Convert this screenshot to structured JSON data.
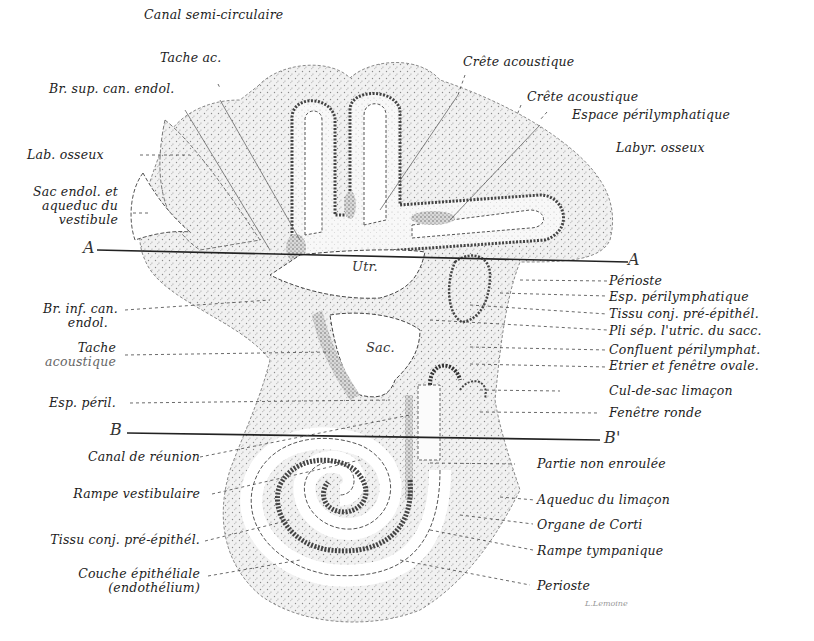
{
  "figure": {
    "cut_lines": [
      {
        "id": "A",
        "start_label": "A",
        "end_label": "A"
      },
      {
        "id": "B",
        "start_label": "B",
        "end_label": "B'"
      }
    ],
    "center_labels": {
      "utricle": "Utr.",
      "saccule": "Sac."
    },
    "labels_top": [
      {
        "text": "Canal semi-circulaire"
      },
      {
        "text": "Tache ac."
      },
      {
        "text": "Crête acoustique"
      },
      {
        "text": "Crête acoustique"
      },
      {
        "text": "Espace périlymphatique"
      },
      {
        "text": "Labyr. osseux"
      }
    ],
    "labels_left": [
      {
        "text": "Br. sup. can. endol."
      },
      {
        "text": "Lab. osseux"
      },
      {
        "text": "Sac endol. et"
      },
      {
        "text": "aqueduc du"
      },
      {
        "text": "vestibule"
      },
      {
        "text": "Br. inf. can."
      },
      {
        "text": "endol."
      },
      {
        "text": "Tache"
      },
      {
        "text": "acoustique"
      },
      {
        "text": "Esp. péril."
      },
      {
        "text": "Canal de réunion"
      },
      {
        "text": "Rampe vestibulaire"
      },
      {
        "text": "Tissu conj. pré-épithél."
      },
      {
        "text": "Couche épithéliale"
      },
      {
        "text": "(endothélium)"
      }
    ],
    "labels_right": [
      {
        "text": "Périoste"
      },
      {
        "text": "Esp. périlymphatique"
      },
      {
        "text": "Tissu conj. pré-épithél."
      },
      {
        "text": "Pli sép. l'utric. du sacc."
      },
      {
        "text": "Confluent périlymphat."
      },
      {
        "text": "Etrier et fenêtre ovale."
      },
      {
        "text": "Cul-de-sac limaçon"
      },
      {
        "text": "Fenêtre ronde"
      },
      {
        "text": "Partie non enroulée"
      },
      {
        "text": "Aqueduc du limaçon"
      },
      {
        "text": "Organe de Corti"
      },
      {
        "text": "Rampe tympanique"
      },
      {
        "text": "Perioste"
      }
    ],
    "signature": "L.Lemoine",
    "colors": {
      "ink": "#1c1c1c",
      "stipple": "#9a9a9a",
      "bone_fill": "#e4e4e4",
      "membrane": "#555555",
      "background": "#ffffff"
    }
  }
}
